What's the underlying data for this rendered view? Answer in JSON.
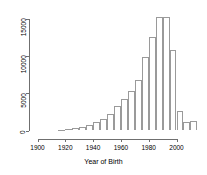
{
  "chart_data": {
    "type": "bar",
    "title": "",
    "subtitle": "",
    "xlabel": "Year of Birth",
    "ylabel": "",
    "binwidth": 5,
    "xlim": [
      1913,
      2016
    ],
    "ylim": [
      0,
      15600
    ],
    "grid": false,
    "legend": null,
    "xticks": [
      1900,
      1920,
      1940,
      1960,
      1980,
      2000
    ],
    "yticks": [
      0,
      5000,
      10000,
      15000
    ],
    "xtick_labels": [
      "1900",
      "1920",
      "1940",
      "1960",
      "1980",
      "2000"
    ],
    "ytick_labels": [
      "0",
      "5000",
      "10000",
      "15000"
    ],
    "categories": [
      "1915",
      "1920",
      "1925",
      "1930",
      "1935",
      "1940",
      "1945",
      "1950",
      "1955",
      "1960",
      "1965",
      "1970",
      "1975",
      "1980",
      "1985",
      "1990",
      "1995",
      "2000",
      "2005",
      "2010"
    ],
    "values": [
      120,
      160,
      330,
      520,
      700,
      1150,
      1600,
      2250,
      3300,
      4250,
      5250,
      6800,
      9900,
      12500,
      15200,
      15200,
      10800,
      2600,
      1200,
      1250
    ],
    "bar_style": {
      "fill": "#ffffff",
      "stroke": "#9a9a9a"
    },
    "axis_color": "#6f6f6f",
    "text_color": "#000000",
    "background": "#ffffff"
  }
}
